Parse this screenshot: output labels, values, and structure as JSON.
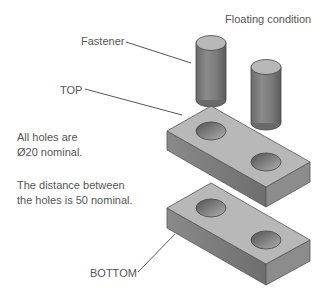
{
  "title": "Floating condition",
  "labels": {
    "fastener": "Fastener",
    "top": "TOP",
    "bottom": "BOTTOM"
  },
  "notes": [
    {
      "line1": "All holes are",
      "line2": "Ø20 nominal."
    },
    {
      "line1": "The distance between",
      "line2": "the holes is 50 nominal."
    }
  ],
  "parts": {
    "fasteners": 2,
    "plates": [
      "TOP",
      "BOTTOM"
    ],
    "holes_per_plate": 2,
    "hole_diameter_nominal": "Ø20",
    "hole_spacing_nominal": "50"
  },
  "colors": {
    "top_face": "#b8b8b8",
    "front_face": "#7a7a7a",
    "side_face": "#8c8c8c",
    "edge": "#555555",
    "leader": "#555555",
    "text": "#555555"
  }
}
